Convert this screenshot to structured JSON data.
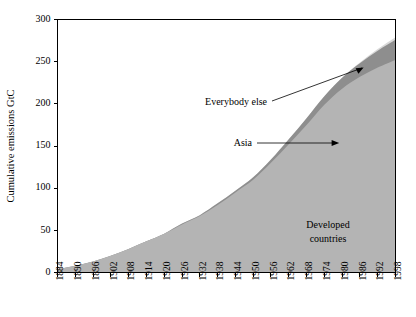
{
  "chart_data": {
    "type": "area",
    "title": "",
    "xlabel": "",
    "ylabel": "Cumulative emissions GtC",
    "stacked": true,
    "grid": false,
    "legend_position": "inline-annotations",
    "xlim": [
      1884,
      1998
    ],
    "ylim": [
      0,
      300
    ],
    "ytick_values": [
      0,
      50,
      100,
      150,
      200,
      250,
      300
    ],
    "ytick_labels": [
      "0",
      "50",
      "100",
      "150",
      "200",
      "250",
      "300"
    ],
    "xtick_labels": [
      "1884",
      "1890",
      "1896",
      "1902",
      "1908",
      "1914",
      "1920",
      "1926",
      "1932",
      "1938",
      "1944",
      "1950",
      "1956",
      "1962",
      "1968",
      "1974",
      "1980",
      "1986",
      "1992",
      "1998"
    ],
    "x": [
      1884,
      1890,
      1896,
      1902,
      1908,
      1914,
      1920,
      1926,
      1932,
      1938,
      1944,
      1950,
      1956,
      1962,
      1968,
      1974,
      1980,
      1986,
      1992,
      1998
    ],
    "series": [
      {
        "name": "Developed countries",
        "color": "#b4b4b4",
        "values": [
          4,
          8,
          13,
          20,
          28,
          37,
          46,
          57,
          67,
          80,
          95,
          110,
          130,
          152,
          175,
          199,
          218,
          232,
          243,
          252
        ]
      },
      {
        "name": "Asia",
        "color": "#8e8e8e",
        "values": [
          0,
          0,
          0,
          0,
          0,
          0,
          0,
          1,
          1,
          2,
          2,
          3,
          4,
          6,
          8,
          10,
          13,
          16,
          20,
          24
        ]
      },
      {
        "name": "Everybody else",
        "color": "#d9d9d9",
        "values": [
          0,
          0,
          0,
          0,
          0,
          0,
          0,
          0,
          0,
          0,
          0,
          0,
          0,
          0,
          0,
          0,
          0,
          1,
          2,
          3
        ]
      }
    ],
    "totals": [
      4,
      8,
      13,
      20,
      28,
      37,
      46,
      58,
      68,
      82,
      97,
      113,
      134,
      158,
      183,
      209,
      231,
      249,
      265,
      279
    ],
    "annotations": [
      {
        "text": "Everybody else",
        "target_series": "Everybody else"
      },
      {
        "text": "Asia",
        "target_series": "Asia"
      },
      {
        "text": "Developed",
        "target_series": "Developed countries"
      },
      {
        "text": "countries",
        "target_series": "Developed countries"
      }
    ]
  },
  "annotation_labels": {
    "everybody_else": "Everybody else",
    "asia": "Asia",
    "developed_line1": "Developed",
    "developed_line2": "countries"
  }
}
